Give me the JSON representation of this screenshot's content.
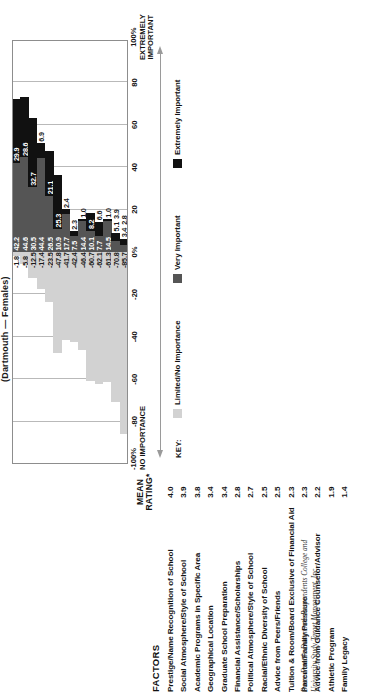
{
  "chart": {
    "title": "(Dartmouth — Females)",
    "headers": {
      "factors": "FACTORS",
      "mean_rating": "MEAN\nRATING*"
    },
    "mean_rating_label_line1": "MEAN",
    "mean_rating_label_line2": "RATING*",
    "axis": {
      "ticks": [
        "-80",
        "-60",
        "-40",
        "-20",
        "0%",
        "20",
        "40",
        "60",
        "80"
      ],
      "left_end_line1": "-100%",
      "left_end_line2": "NO IMPORTANCE",
      "right_end_line1": "100%",
      "right_end_line2": "EXTREMELY",
      "right_end_line3": "IMPORTANT"
    },
    "key": {
      "label": "KEY:",
      "items": [
        {
          "name": "Limited/No Importance",
          "color": "#d2d2d2"
        },
        {
          "name": "Very Important",
          "color": "#555555"
        },
        {
          "name": "Extremely Important",
          "color": "#111111"
        }
      ]
    },
    "footnote": "Base: Female Dartmouth Respondents College and University Study Target Management, Inc."
  },
  "chart_data": {
    "type": "bar",
    "subtype": "diverging-stacked-horizontal",
    "title": "(Dartmouth — Females)",
    "xlabel": "",
    "ylabel": "",
    "xlim": [
      -100,
      100
    ],
    "grid": true,
    "legend_position": "bottom",
    "xticks": [
      -80,
      -60,
      -40,
      -20,
      0,
      20,
      40,
      60,
      80
    ],
    "categories": [
      "Prestige/Name Recognition of School",
      "Social Atmosphere/Style of School",
      "Academic Programs in Specific Area",
      "Geographical Location",
      "Graduate School Preparation",
      "Financial Assistance/Scholarships",
      "Political Atmosphere/Style of School",
      "Racial/Ethnic Diversity of School",
      "Advice from Peers/Friends",
      "Tuition & Room/Board Exclusive of Financial Aid",
      "Parental/Family Pressure",
      "Advice from Guidance Counselor/Advisor",
      "Athletic Program",
      "Family Legacy"
    ],
    "mean_rating": [
      4.0,
      3.9,
      3.8,
      3.4,
      3.4,
      2.8,
      2.7,
      2.5,
      2.5,
      2.3,
      2.3,
      2.2,
      1.9,
      1.4
    ],
    "series": [
      {
        "name": "Limited/No Importance",
        "color": "#d2d2d2",
        "values": [
          -1.8,
          -5.8,
          -12.5,
          -17.4,
          -23.5,
          -47.8,
          -41.7,
          -42.4,
          -46.4,
          -60.7,
          -62.1,
          -61.3,
          -70.8,
          -85.7
        ]
      },
      {
        "name": "Very Important",
        "color": "#555555",
        "values": [
          42.2,
          44.6,
          30.5,
          44.4,
          26.5,
          10.9,
          17.7,
          7.5,
          14.4,
          10.1,
          7.7,
          14.5,
          5.1,
          3.4
        ]
      },
      {
        "name": "Extremely Important",
        "color": "#111111",
        "values": [
          29.9,
          28.6,
          32.7,
          6.9,
          21.1,
          25.3,
          0.0,
          2.3,
          1.0,
          8.2,
          6.6,
          1.0,
          3.9,
          2.8
        ]
      }
    ],
    "rows": [
      {
        "factor": "Prestige/Name Recognition of School",
        "mean": "4.0",
        "limited": "-1.8",
        "very": "42.2",
        "extremely": "29.9"
      },
      {
        "factor": "Social Atmosphere/Style of School",
        "mean": "3.9",
        "limited": "-5.8",
        "very": "44.6",
        "extremely": "28.6"
      },
      {
        "factor": "Academic Programs in Specific Area",
        "mean": "3.8",
        "limited": "-12.5",
        "very": "30.5",
        "extremely": "32.7"
      },
      {
        "factor": "Geographical Location",
        "mean": "3.4",
        "limited": "-17.4",
        "very": "44.4",
        "extremely": "6.9"
      },
      {
        "factor": "Graduate School Preparation",
        "mean": "3.4",
        "limited": "-23.5",
        "very": "26.5",
        "extremely": "21.1"
      },
      {
        "factor": "Financial Assistance/Scholarships",
        "mean": "2.8",
        "limited": "-47.8",
        "very": "10.9",
        "extremely": "25.3"
      },
      {
        "factor": "Political Atmosphere/Style of School",
        "mean": "2.7",
        "limited": "-41.7",
        "very": "17.7",
        "extremely": "2.4"
      },
      {
        "factor": "Racial/Ethnic Diversity of School",
        "mean": "2.5",
        "limited": "-42.4",
        "very": "7.5",
        "extremely": "2.3"
      },
      {
        "factor": "Advice from Peers/Friends",
        "mean": "2.5",
        "limited": "-46.4",
        "very": "14.4",
        "extremely": "1.0"
      },
      {
        "factor": "Tuition & Room/Board Exclusive of Financial Aid",
        "mean": "2.3",
        "limited": "-60.7",
        "very": "10.1",
        "extremely": "8.2"
      },
      {
        "factor": "Parental/Family Pressure",
        "mean": "2.3",
        "limited": "-62.1",
        "very": "7.7",
        "extremely": "6.6"
      },
      {
        "factor": "Advice from Guidance Counselor/Advisor",
        "mean": "2.2",
        "limited": "-61.3",
        "very": "14.5",
        "extremely": "1.0"
      },
      {
        "factor": "Athletic Program",
        "mean": "1.9",
        "limited": "-70.8",
        "very": "5.1",
        "extremely": "3.9"
      },
      {
        "factor": "Family Legacy",
        "mean": "1.4",
        "limited": "-85.7",
        "very": "3.4",
        "extremely": "2.8"
      }
    ]
  }
}
